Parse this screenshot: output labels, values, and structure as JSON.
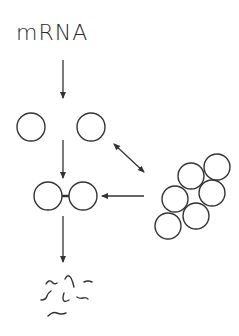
{
  "diagram": {
    "title": "mRNA",
    "stroke_color": "#333333",
    "nodes": {
      "monomer_left": {
        "cx": 31,
        "cy": 127,
        "r": 14
      },
      "monomer_right": {
        "cx": 91,
        "cy": 127,
        "r": 14
      },
      "dimer_left": {
        "cx": 48,
        "cy": 196,
        "r": 14
      },
      "dimer_right": {
        "cx": 83,
        "cy": 196,
        "r": 14
      },
      "aggregate": [
        {
          "cx": 217,
          "cy": 167,
          "r": 13
        },
        {
          "cx": 191,
          "cy": 176,
          "r": 13
        },
        {
          "cx": 212,
          "cy": 193,
          "r": 13
        },
        {
          "cx": 175,
          "cy": 199,
          "r": 13
        },
        {
          "cx": 196,
          "cy": 216,
          "r": 13
        },
        {
          "cx": 168,
          "cy": 226,
          "r": 13
        }
      ]
    },
    "arrows": [
      {
        "name": "mrna-to-monomers",
        "x1": 63,
        "y1": 60,
        "x2": 63,
        "y2": 98
      },
      {
        "name": "monomers-to-dimer",
        "x1": 63,
        "y1": 140,
        "x2": 63,
        "y2": 178
      },
      {
        "name": "dimer-to-fragments",
        "x1": 63,
        "y1": 216,
        "x2": 63,
        "y2": 262
      },
      {
        "name": "aggregate-to-dimer",
        "x1": 144,
        "y1": 196,
        "x2": 102,
        "y2": 196
      },
      {
        "name": "monomers-aggregate-equilibrium",
        "x1": 114,
        "y1": 144,
        "x2": 144,
        "y2": 172,
        "double": true
      }
    ],
    "fragments_label": "degraded fragments"
  }
}
